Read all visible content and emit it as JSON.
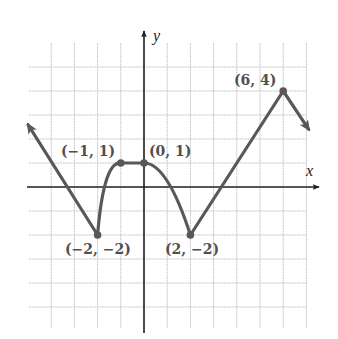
{
  "chart_data": {
    "type": "line",
    "title": "",
    "xlabel": "x",
    "ylabel": "y",
    "grid": true,
    "xlim": [
      -5,
      7
    ],
    "ylim": [
      -6,
      6
    ],
    "grid_x_range": [
      -4,
      7
    ],
    "grid_y_range": [
      -5,
      5
    ],
    "series": [
      {
        "name": "f(x)",
        "description": "Piecewise function: arrow from upper-left descending linearly to (-2,-2); concave-down rise to (-1,1); horizontal segment to (0,1); downward parabola to (2,-2); straight line up to (6,4); then descending arrow to lower-right.",
        "points": [
          {
            "x": -5.0,
            "y": 2.6,
            "note": "arrow (continues)"
          },
          {
            "x": -2,
            "y": -2
          },
          {
            "x": -1,
            "y": 1
          },
          {
            "x": 0,
            "y": 1
          },
          {
            "x": 2,
            "y": -2
          },
          {
            "x": 6,
            "y": 4
          },
          {
            "x": 7.1,
            "y": 2.4,
            "note": "arrow (continues)"
          }
        ]
      }
    ],
    "annotations": [
      {
        "text": "(-1, 1)",
        "display": "(−1, 1)",
        "x": -1,
        "y": 1
      },
      {
        "text": "(0, 1)",
        "display": "(0, 1)",
        "x": 0,
        "y": 1
      },
      {
        "text": "(-2, -2)",
        "display": "(−2, −2)",
        "x": -2,
        "y": -2
      },
      {
        "text": "(2, -2)",
        "display": "(2, −2)",
        "x": 2,
        "y": -2
      },
      {
        "text": "(6, 4)",
        "display": "(6, 4)",
        "x": 6,
        "y": 4
      }
    ]
  },
  "axes": {
    "x_label": "x",
    "y_label": "y"
  },
  "labels": {
    "p_m1_1": "(−1, 1)",
    "p_0_1": "(0, 1)",
    "p_m2_m2": "(−2, −2)",
    "p_2_m2": "(2, −2)",
    "p_6_4": "(6, 4)"
  },
  "colors": {
    "curve": "#585858",
    "axis": "#1e1e1e",
    "grid": "#c9c9c9"
  }
}
